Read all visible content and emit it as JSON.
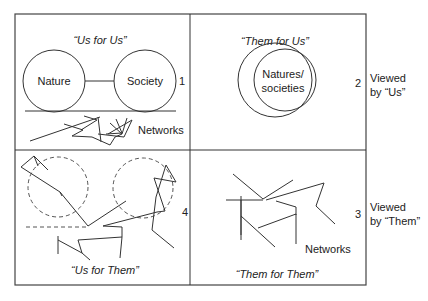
{
  "quadrants": {
    "q1": {
      "title": "“Us for Us”",
      "number": "1",
      "circle_left_label": "Nature",
      "circle_right_label": "Society",
      "network_label": "Networks"
    },
    "q2": {
      "title": "“Them for Us”",
      "number": "2",
      "circle_label_line1": "Natures/",
      "circle_label_line2": "societies"
    },
    "q3": {
      "title": "“Them for Them”",
      "number": "3",
      "network_label": "Networks"
    },
    "q4": {
      "title": "“Us for Them”",
      "number": "4"
    }
  },
  "side_labels": {
    "top_line1": "Viewed",
    "top_line2": "by “Us”",
    "bottom_line1": "Viewed",
    "bottom_line2": "by “Them”"
  },
  "colors": {
    "line": "#333333",
    "text": "#222222",
    "background": "#ffffff"
  }
}
